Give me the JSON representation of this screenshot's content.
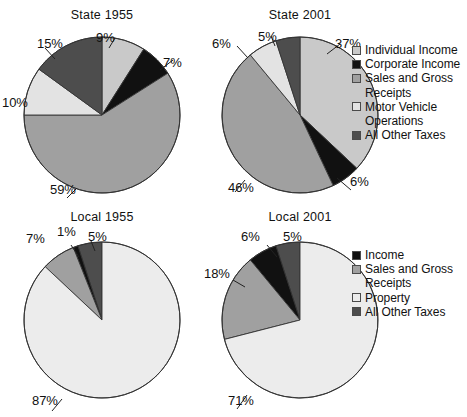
{
  "figure": {
    "background_color": "#ffffff",
    "outline_color": "#333333"
  },
  "palette": {
    "individual_income": "#c9c9c9",
    "corporate_income": "#111111",
    "sales_gross_receipts": "#a0a0a0",
    "motor_vehicle": "#e3e3e3",
    "all_other_taxes": "#4d4d4d",
    "income": "#111111",
    "property": "#ececec"
  },
  "legends": {
    "state": {
      "name": "state-legend",
      "items": [
        {
          "label": "Individual Income",
          "color": "#c9c9c9"
        },
        {
          "label": "Corporate Income",
          "color": "#111111"
        },
        {
          "label": "Sales and Gross\nReceipts",
          "color": "#a0a0a0"
        },
        {
          "label": "Motor Vehicle\nOperations",
          "color": "#e3e3e3"
        },
        {
          "label": "All Other Taxes",
          "color": "#4d4d4d"
        }
      ]
    },
    "local": {
      "name": "local-legend",
      "items": [
        {
          "label": "Income",
          "color": "#111111"
        },
        {
          "label": "Sales and Gross\nReceipts",
          "color": "#a0a0a0"
        },
        {
          "label": "Property",
          "color": "#ececec"
        },
        {
          "label": "All Other Taxes",
          "color": "#4d4d4d"
        }
      ]
    }
  },
  "chart_data": [
    {
      "type": "pie",
      "title": "State 1955",
      "categories": [
        "Individual Income",
        "Corporate Income",
        "Sales and Gross Receipts",
        "Motor Vehicle Operations",
        "All Other Taxes"
      ],
      "values": [
        9,
        7,
        59,
        10,
        15
      ],
      "labels": [
        "9%",
        "7%",
        "59%",
        "10%",
        "15%"
      ],
      "colors": [
        "#c9c9c9",
        "#111111",
        "#a0a0a0",
        "#e3e3e3",
        "#4d4d4d"
      ],
      "start_angle": 0,
      "direction": "clockwise",
      "legend": "state"
    },
    {
      "type": "pie",
      "title": "State 2001",
      "categories": [
        "Individual Income",
        "Corporate Income",
        "Sales and Gross Receipts",
        "Motor Vehicle Operations",
        "All Other Taxes"
      ],
      "values": [
        37,
        6,
        46,
        6,
        5
      ],
      "labels": [
        "37%",
        "6%",
        "46%",
        "6%",
        "5%"
      ],
      "colors": [
        "#c9c9c9",
        "#111111",
        "#a0a0a0",
        "#e3e3e3",
        "#4d4d4d"
      ],
      "start_angle": 0,
      "direction": "clockwise",
      "legend": "state"
    },
    {
      "type": "pie",
      "title": "Local 1955",
      "categories": [
        "All Other Taxes",
        "Income",
        "Sales and Gross Receipts",
        "Property"
      ],
      "values": [
        5,
        1,
        7,
        87
      ],
      "labels": [
        "5%",
        "1%",
        "7%",
        "87%"
      ],
      "colors": [
        "#4d4d4d",
        "#111111",
        "#a0a0a0",
        "#ececec"
      ],
      "start_angle": 0,
      "direction": "counterclockwise",
      "legend": "local"
    },
    {
      "type": "pie",
      "title": "Local 2001",
      "categories": [
        "All Other Taxes",
        "Income",
        "Sales and Gross Receipts",
        "Property"
      ],
      "values": [
        5,
        6,
        18,
        71
      ],
      "labels": [
        "5%",
        "6%",
        "18%",
        "71%"
      ],
      "colors": [
        "#4d4d4d",
        "#111111",
        "#a0a0a0",
        "#ececec"
      ],
      "start_angle": 0,
      "direction": "counterclockwise",
      "legend": "local"
    }
  ],
  "charts": {
    "state_1955": {
      "title": "State 1955",
      "pct": {
        "individual": "9%",
        "corporate": "7%",
        "sales": "59%",
        "motor": "10%",
        "other": "15%"
      }
    },
    "state_2001": {
      "title": "State 2001",
      "pct": {
        "individual": "37%",
        "corporate": "6%",
        "sales": "46%",
        "motor": "6%",
        "other": "5%"
      }
    },
    "local_1955": {
      "title": "Local 1955",
      "pct": {
        "other": "5%",
        "income": "1%",
        "sales": "7%",
        "property": "87%"
      }
    },
    "local_2001": {
      "title": "Local 2001",
      "pct": {
        "other": "5%",
        "income": "6%",
        "sales": "18%",
        "property": "71%"
      }
    }
  }
}
